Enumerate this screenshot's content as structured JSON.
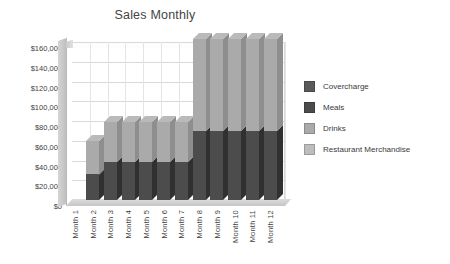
{
  "chart_data": {
    "type": "bar",
    "subtype": "stacked-3d-column",
    "title": "Sales Monthly",
    "xlabel": "",
    "ylabel": "",
    "ylim": [
      0,
      160000
    ],
    "grid": true,
    "legend_position": "right",
    "categories": [
      "Month 1",
      "Month 2",
      "Month 3",
      "Month 4",
      "Month 5",
      "Month 6",
      "Month 7",
      "Month 8",
      "Month 9",
      "Month 10",
      "Month 11",
      "Month 12"
    ],
    "ytick_labels": [
      "$0",
      "$20,000",
      "$40,000",
      "$60,000",
      "$80,000",
      "$100,000",
      "$120,000",
      "$140,000",
      "$160,000"
    ],
    "ytick_values": [
      0,
      20000,
      40000,
      60000,
      80000,
      100000,
      120000,
      140000,
      160000
    ],
    "series": [
      {
        "name": "Covercharge",
        "color": "#5a5a5a",
        "values": [
          0,
          0,
          0,
          0,
          0,
          0,
          0,
          0,
          0,
          0,
          0,
          0
        ]
      },
      {
        "name": "Meals",
        "color": "#4c4c4c",
        "values": [
          0,
          26000,
          38000,
          38000,
          38000,
          38000,
          38000,
          70000,
          70000,
          70000,
          70000,
          70000
        ]
      },
      {
        "name": "Drinks",
        "color": "#aaaaaa",
        "values": [
          0,
          34000,
          41000,
          41000,
          41000,
          41000,
          41000,
          93000,
          93000,
          93000,
          93000,
          93000
        ]
      },
      {
        "name": "Restaurant Merchandise",
        "color": "#bdbdbd",
        "values": [
          0,
          0,
          0,
          0,
          0,
          0,
          0,
          0,
          0,
          0,
          0,
          0
        ]
      }
    ],
    "totals": [
      0,
      60000,
      79000,
      79000,
      79000,
      79000,
      79000,
      163000,
      163000,
      163000,
      163000,
      163000
    ]
  },
  "legend": {
    "items": [
      {
        "label": "Covercharge",
        "color": "#5a5a5a"
      },
      {
        "label": "Meals",
        "color": "#4c4c4c"
      },
      {
        "label": "Drinks",
        "color": "#aaaaaa"
      },
      {
        "label": "Restaurant Merchandise",
        "color": "#bdbdbd"
      }
    ]
  }
}
